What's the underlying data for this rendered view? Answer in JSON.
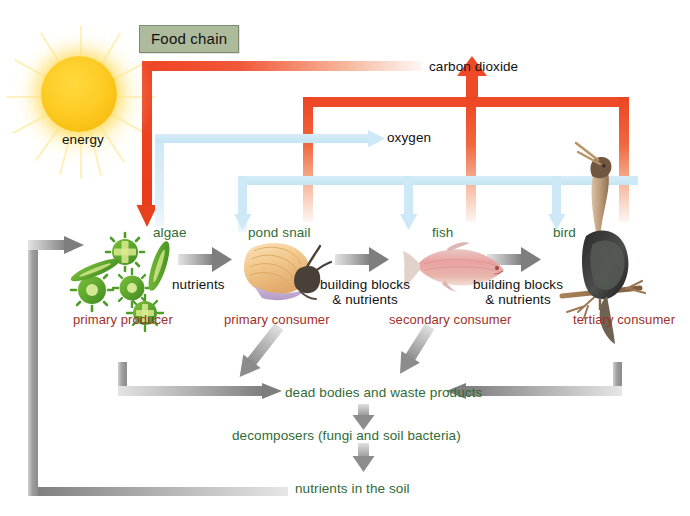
{
  "diagram": {
    "title": "Food chain",
    "type": "ecology-nutrient-cycle"
  },
  "energy": {
    "label": "energy",
    "source": "sun"
  },
  "gases": {
    "carbon_dioxide": "carbon dioxide",
    "oxygen": "oxygen"
  },
  "trophic_levels": [
    {
      "organism": "algae",
      "role": "primary producer",
      "icon": "algae-cells-icon"
    },
    {
      "organism": "pond snail",
      "role": "primary consumer",
      "icon": "pond-snail-icon"
    },
    {
      "organism": "fish",
      "role": "secondary consumer",
      "icon": "fish-icon"
    },
    {
      "organism": "bird",
      "role": "tertiary consumer",
      "icon": "bird-icon"
    }
  ],
  "transfer_labels": [
    {
      "text": "nutrients"
    },
    {
      "text_line1": "building blocks",
      "text_line2": "& nutrients"
    },
    {
      "text_line1": "building blocks",
      "text_line2": "& nutrients"
    }
  ],
  "decomposition_chain": [
    {
      "text": "dead bodies and waste products"
    },
    {
      "text": "decomposers (fungi and soil bacteria)"
    },
    {
      "text": "nutrients in the soil"
    }
  ],
  "colors": {
    "carbon_dioxide_arrow": "#ee4422",
    "oxygen_arrow": "#cde8f5",
    "matter_arrow": "#9a9a9a",
    "organism_label": "#2f6b36",
    "role_label": "#a03028",
    "title_chip_bg": "#adbb9c",
    "sun": "#fdcb24",
    "background": "#ffffff"
  }
}
